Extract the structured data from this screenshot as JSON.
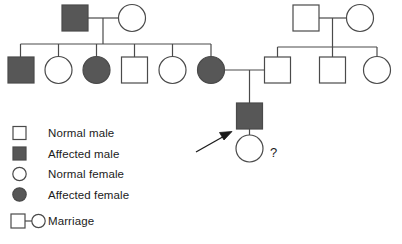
{
  "diagram": {
    "type": "pedigree-chart",
    "colors": {
      "affected_fill": "#575757",
      "unaffected_fill": "#ffffff",
      "stroke": "#4a4a4a",
      "text": "#1b1b1b",
      "background": "#ffffff"
    },
    "proband_marker": {
      "name": "proband-arrow",
      "points_to": "affected-male-generation-iii"
    },
    "unknown_marker": {
      "label": "?",
      "applies_to": "generation-iv-female"
    }
  },
  "legend": {
    "items": [
      {
        "symbol": "square-open",
        "shape": "square",
        "filled": false,
        "label": "Normal male"
      },
      {
        "symbol": "square-filled",
        "shape": "square",
        "filled": true,
        "label": "Affected male"
      },
      {
        "symbol": "circle-open",
        "shape": "circle",
        "filled": false,
        "label": "Normal female"
      },
      {
        "symbol": "circle-filled",
        "shape": "circle",
        "filled": true,
        "label": "Affected female"
      },
      {
        "symbol": "marriage-pair",
        "shape": "pair",
        "filled": false,
        "label": "Marriage"
      }
    ]
  },
  "generations": {
    "generation_i": {
      "left_couple": [
        {
          "id": "gi-left-male",
          "shape": "square",
          "sex": "male",
          "affected": true,
          "label": "Affected male"
        },
        {
          "id": "gi-left-female",
          "shape": "circle",
          "sex": "female",
          "affected": false,
          "label": "Normal female"
        }
      ],
      "right_couple": [
        {
          "id": "gi-right-male",
          "shape": "square",
          "sex": "male",
          "affected": false,
          "label": "Normal male"
        },
        {
          "id": "gi-right-female",
          "shape": "circle",
          "sex": "female",
          "affected": false,
          "label": "Normal female"
        }
      ]
    },
    "generation_ii": {
      "left_sibship": [
        {
          "id": "gii-1",
          "shape": "square",
          "sex": "male",
          "affected": true,
          "label": "Affected male"
        },
        {
          "id": "gii-2",
          "shape": "circle",
          "sex": "female",
          "affected": false,
          "label": "Normal female"
        },
        {
          "id": "gii-3",
          "shape": "circle",
          "sex": "female",
          "affected": true,
          "label": "Affected female"
        },
        {
          "id": "gii-4",
          "shape": "square",
          "sex": "male",
          "affected": false,
          "label": "Normal male"
        },
        {
          "id": "gii-5",
          "shape": "circle",
          "sex": "female",
          "affected": false,
          "label": "Normal female"
        },
        {
          "id": "gii-6",
          "shape": "circle",
          "sex": "female",
          "affected": true,
          "label": "Affected female"
        }
      ],
      "right_sibship": [
        {
          "id": "gii-7",
          "shape": "square",
          "sex": "male",
          "affected": false,
          "label": "Normal male"
        },
        {
          "id": "gii-8",
          "shape": "square",
          "sex": "male",
          "affected": false,
          "label": "Normal male"
        },
        {
          "id": "gii-9",
          "shape": "circle",
          "sex": "female",
          "affected": false,
          "label": "Normal female"
        }
      ],
      "center_marriage": [
        "gii-6",
        "gii-7"
      ]
    },
    "generation_iii": {
      "members": [
        {
          "id": "giii-1",
          "shape": "square",
          "sex": "male",
          "affected": true,
          "label": "Affected male"
        }
      ]
    },
    "generation_iv": {
      "members": [
        {
          "id": "giv-1",
          "shape": "circle",
          "sex": "female",
          "affected": false,
          "label": "Normal female",
          "status": "?"
        }
      ]
    }
  }
}
